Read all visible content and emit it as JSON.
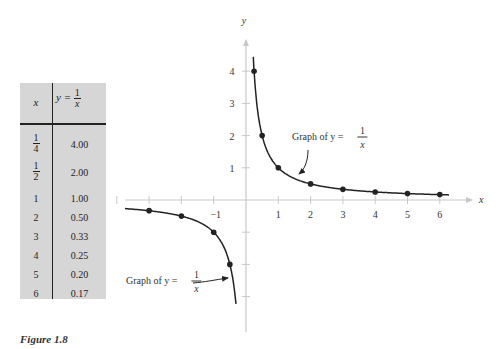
{
  "table": {
    "header_x": "x",
    "header_y_prefix": "y =",
    "header_y_num": "1",
    "header_y_den": "x",
    "rows": [
      {
        "x": "1/4",
        "x_num": "1",
        "x_den": "4",
        "y": "4.00"
      },
      {
        "x": "1/2",
        "x_num": "1",
        "x_den": "2",
        "y": "2.00"
      },
      {
        "x": "1",
        "y": "1.00"
      },
      {
        "x": "2",
        "y": "0.50"
      },
      {
        "x": "3",
        "y": "0.33"
      },
      {
        "x": "4",
        "y": "0.25"
      },
      {
        "x": "5",
        "y": "0.20"
      },
      {
        "x": "6",
        "y": "0.17"
      }
    ]
  },
  "caption": "Figure 1.8",
  "annotations": {
    "upper": {
      "prefix": "Graph of y =",
      "num": "1",
      "den": "x"
    },
    "lower": {
      "prefix": "Graph of y =",
      "num": "1",
      "den": "x"
    }
  },
  "axis_labels": {
    "x": "x",
    "y": "y",
    "neg_one": "−1"
  },
  "chart_data": {
    "type": "line",
    "xlabel": "x",
    "ylabel": "y",
    "xlim": [
      -4,
      7
    ],
    "ylim": [
      -4,
      4.5
    ],
    "x_ticks": [
      -4,
      -3,
      -2,
      -1,
      1,
      2,
      3,
      4,
      5,
      6
    ],
    "x_tick_labels_shown": [
      "-1",
      "1",
      "2",
      "3",
      "4",
      "5",
      "6"
    ],
    "y_ticks": [
      -3,
      -2,
      -1,
      1,
      2,
      3,
      4
    ],
    "y_tick_labels_shown": [
      "1",
      "2",
      "3",
      "4"
    ],
    "grid": false,
    "series": [
      {
        "name": "y = 1/x (x > 0)",
        "x": [
          0.25,
          0.5,
          1,
          2,
          3,
          4,
          5,
          6
        ],
        "y": [
          4.0,
          2.0,
          1.0,
          0.5,
          0.33,
          0.25,
          0.2,
          0.17
        ]
      },
      {
        "name": "y = 1/x (x < 0)",
        "x": [
          -3,
          -2,
          -1,
          -0.5
        ],
        "y": [
          -0.33,
          -0.5,
          -1.0,
          -2.0
        ]
      }
    ],
    "table": {
      "columns": [
        "x",
        "y = 1/x"
      ],
      "rows": [
        [
          "1/4",
          "4.00"
        ],
        [
          "1/2",
          "2.00"
        ],
        [
          "1",
          "1.00"
        ],
        [
          "2",
          "0.50"
        ],
        [
          "3",
          "0.33"
        ],
        [
          "4",
          "0.25"
        ],
        [
          "5",
          "0.20"
        ],
        [
          "6",
          "0.17"
        ]
      ]
    }
  }
}
